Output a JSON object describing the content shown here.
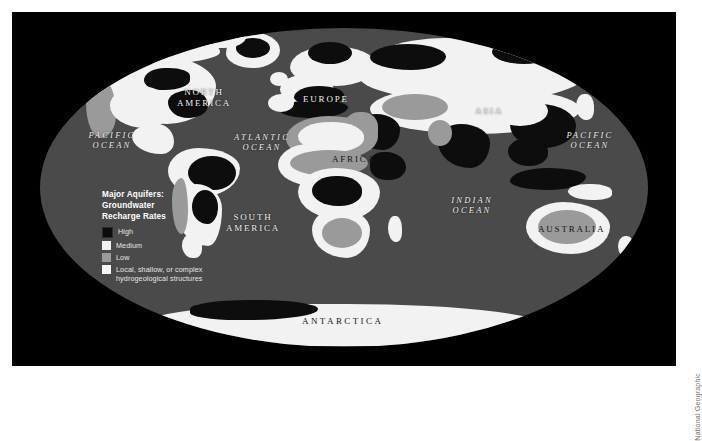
{
  "figure": {
    "credit": "National Geographic",
    "background_color": "#ffffff",
    "panel_color": "#000000",
    "ocean_color": "#4a4a4a"
  },
  "legend": {
    "title_line1": "Major Aquifers:",
    "title_line2": "Groundwater",
    "title_line3": "Recharge Rates",
    "entries": [
      {
        "label": "High",
        "color": "#0d0d0d"
      },
      {
        "label": "Medium",
        "color": "#f2f2f2"
      },
      {
        "label": "Low",
        "color": "#9a9a9a"
      },
      {
        "label_line1": "Local, shallow, or complex",
        "label_line2": "hydrogeological structures",
        "color": "#f7f7f7"
      }
    ]
  },
  "map_labels": {
    "north_america_l1": "NORTH",
    "north_america_l2": "AMERICA",
    "south_america_l1": "SOUTH",
    "south_america_l2": "AMERICA",
    "europe": "EUROPE",
    "asia": "ASIA",
    "africa": "AFRICA",
    "australia": "AUSTRALIA",
    "antarctica": "ANTARCTICA",
    "pacific_west_l1": "PACIFIC",
    "pacific_west_l2": "OCEAN",
    "pacific_east_l1": "PACIFIC",
    "pacific_east_l2": "OCEAN",
    "atlantic_l1": "ATLANTIC",
    "atlantic_l2": "OCEAN",
    "indian_l1": "INDIAN",
    "indian_l2": "OCEAN"
  }
}
